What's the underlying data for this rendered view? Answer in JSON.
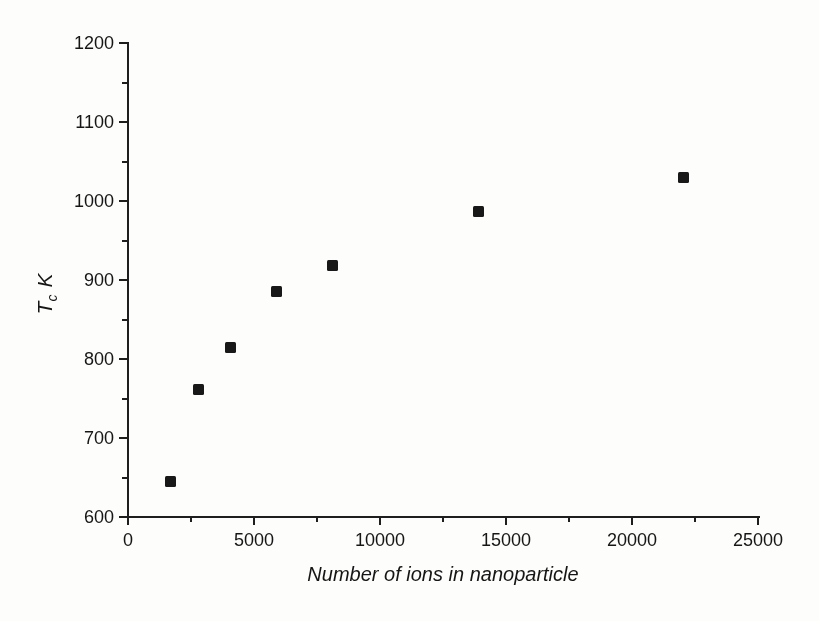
{
  "figure": {
    "background": "#fdfdfc",
    "ink_color": "#1c1c1c"
  },
  "chart_data": {
    "type": "scatter",
    "title": "",
    "xlabel": "Number of ions in nanoparticle",
    "ylabel": "Tc K",
    "ylabel_parts": {
      "symbol": "T",
      "subscript": "c",
      "unit": "K"
    },
    "xlim": [
      0,
      25000
    ],
    "ylim": [
      600,
      1200
    ],
    "x_major_ticks": [
      0,
      5000,
      10000,
      15000,
      20000,
      25000
    ],
    "x_minor_ticks": [
      2500,
      7500,
      12500,
      17500,
      22500
    ],
    "y_major_ticks": [
      600,
      700,
      800,
      900,
      1000,
      1100,
      1200
    ],
    "y_minor_ticks": [
      650,
      750,
      850,
      950,
      1050,
      1150
    ],
    "grid": false,
    "legend": null,
    "marker": {
      "shape": "square",
      "size_px": 11,
      "color": "#181818"
    },
    "points": [
      {
        "x": 1700,
        "y": 645
      },
      {
        "x": 2800,
        "y": 762
      },
      {
        "x": 4050,
        "y": 815
      },
      {
        "x": 5900,
        "y": 886
      },
      {
        "x": 8100,
        "y": 918
      },
      {
        "x": 13900,
        "y": 987
      },
      {
        "x": 22050,
        "y": 1030
      }
    ]
  }
}
